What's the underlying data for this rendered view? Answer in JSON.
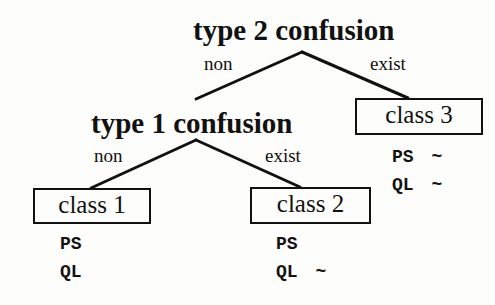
{
  "diagram": {
    "root": {
      "label": "type 2 confusion",
      "left_branch": "non",
      "right_branch": "exist"
    },
    "inner": {
      "label": "type 1 confusion",
      "left_branch": "non",
      "right_branch": "exist"
    },
    "leaves": [
      {
        "label": "class 1",
        "attrs": [
          {
            "name": "PS",
            "mark": ""
          },
          {
            "name": "QL",
            "mark": ""
          }
        ]
      },
      {
        "label": "class 2",
        "attrs": [
          {
            "name": "PS",
            "mark": ""
          },
          {
            "name": "QL",
            "mark": "~"
          }
        ]
      },
      {
        "label": "class 3",
        "attrs": [
          {
            "name": "PS",
            "mark": "~"
          },
          {
            "name": "QL",
            "mark": "~"
          }
        ]
      }
    ]
  }
}
